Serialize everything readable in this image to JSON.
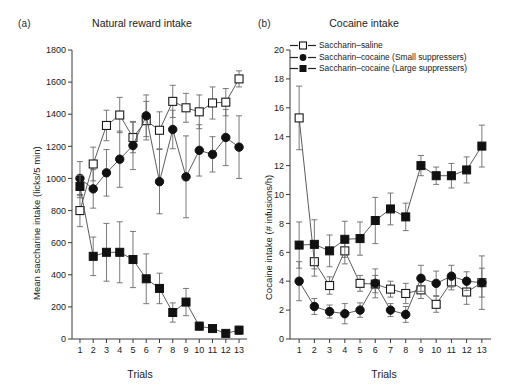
{
  "figure": {
    "panels": [
      {
        "tag": "(a)",
        "title": "Natural reward intake",
        "ylabel": "Mean saccharine intake (licks/5 min)",
        "xlabel": "Trials"
      },
      {
        "tag": "(b)",
        "title": "Cocaine intake",
        "ylabel": "Cocaine intake (# infusions/h)",
        "xlabel": "Trials"
      }
    ],
    "legend": {
      "items": [
        {
          "label": "Saccharin–saline",
          "marker": "open-square",
          "color": "#111111"
        },
        {
          "label": "Saccharin–cocaine (Small suppressers)",
          "marker": "filled-circle",
          "color": "#111111"
        },
        {
          "label": "Saccharin–cocaine  (Large suppressers)",
          "marker": "filled-square",
          "color": "#111111"
        }
      ]
    }
  },
  "chart_data": [
    {
      "type": "line",
      "panel": "a",
      "title": "Natural reward intake",
      "xlabel": "Trials",
      "ylabel": "Mean saccharine intake (licks/5 min)",
      "x": [
        1,
        2,
        3,
        4,
        5,
        6,
        7,
        8,
        9,
        10,
        11,
        12,
        13
      ],
      "xticklabels": [
        "1",
        "2",
        "3",
        "4",
        "5",
        "6",
        "7",
        "8",
        "9",
        "10",
        "11",
        "12",
        "13"
      ],
      "xlim": [
        0.4,
        13.6
      ],
      "ylim": [
        0,
        1800
      ],
      "yticks": [
        0,
        200,
        400,
        600,
        800,
        1000,
        1200,
        1400,
        1600,
        1800
      ],
      "grid": false,
      "legend_position": "panel-b-top",
      "series": [
        {
          "name": "Saccharin–saline",
          "marker": "open-square",
          "values": [
            800,
            1090,
            1330,
            1395,
            1255,
            1360,
            1300,
            1480,
            1440,
            1415,
            1470,
            1475,
            1620
          ],
          "errors": [
            100,
            105,
            95,
            110,
            95,
            120,
            115,
            100,
            90,
            105,
            100,
            85,
            50
          ]
        },
        {
          "name": "Saccharin–cocaine (Small suppressers)",
          "marker": "filled-circle",
          "values": [
            1000,
            935,
            1035,
            1120,
            1205,
            1390,
            980,
            1305,
            1010,
            1175,
            1150,
            1255,
            1195,
            955
          ],
          "errors": [
            105,
            120,
            145,
            175,
            150,
            130,
            200,
            120,
            255,
            160,
            110,
            175,
            195,
            205
          ]
        },
        {
          "name": "Saccharin–cocaine  (Large suppressers)",
          "marker": "filled-square",
          "values": [
            950,
            515,
            540,
            540,
            495,
            375,
            315,
            165,
            230,
            80,
            65,
            35,
            55
          ],
          "errors": [
            70,
            120,
            180,
            190,
            175,
            155,
            95,
            60,
            85,
            25,
            20,
            12,
            25
          ]
        }
      ]
    },
    {
      "type": "line",
      "panel": "b",
      "title": "Cocaine intake",
      "xlabel": "Trials",
      "ylabel": "Cocaine intake (# infusions/h)",
      "x": [
        1,
        2,
        3,
        4,
        5,
        6,
        7,
        8,
        9,
        10,
        11,
        12,
        13
      ],
      "xticklabels": [
        "1",
        "2",
        "3",
        "4",
        "5",
        "6",
        "7",
        "8",
        "9",
        "10",
        "11",
        "12",
        "13"
      ],
      "xlim": [
        0.4,
        13.6
      ],
      "ylim": [
        0,
        20
      ],
      "yticks": [
        0,
        2,
        4,
        6,
        8,
        10,
        12,
        14,
        16,
        18,
        20
      ],
      "grid": false,
      "legend_position": "top-right",
      "series": [
        {
          "name": "Saccharin–saline",
          "marker": "open-square",
          "values": [
            15.3,
            5.35,
            3.7,
            6.1,
            3.85,
            3.8,
            3.45,
            3.15,
            3.4,
            2.4,
            3.95,
            3.25,
            3.9
          ],
          "errors": [
            2.2,
            1.0,
            0.6,
            0.9,
            0.55,
            0.6,
            0.55,
            0.7,
            0.6,
            0.55,
            0.55,
            0.85,
            1.0
          ]
        },
        {
          "name": "Saccharin–cocaine (Small suppressers)",
          "marker": "filled-circle",
          "values": [
            4.0,
            2.25,
            1.9,
            1.75,
            2.0,
            3.85,
            2.0,
            1.7,
            4.2,
            3.85,
            4.35,
            4.0,
            3.9
          ],
          "errors": [
            1.35,
            0.55,
            0.45,
            0.7,
            0.5,
            1.0,
            0.45,
            0.55,
            0.9,
            0.85,
            0.75,
            0.65,
            1.85
          ]
        },
        {
          "name": "Saccharin–cocaine  (Large suppressers)",
          "marker": "filled-square",
          "values": [
            6.5,
            6.55,
            6.1,
            6.9,
            6.95,
            8.2,
            9.0,
            8.45,
            12.0,
            11.3,
            11.3,
            11.7,
            13.35
          ],
          "errors": [
            1.6,
            1.7,
            1.1,
            1.25,
            1.15,
            1.6,
            1.1,
            0.95,
            0.7,
            0.6,
            0.85,
            0.9,
            1.45
          ]
        }
      ]
    }
  ]
}
